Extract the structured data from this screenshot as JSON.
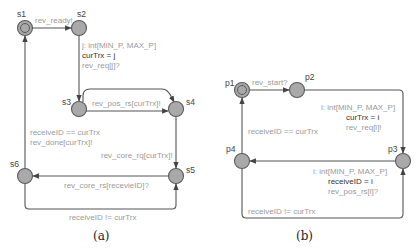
{
  "diagram_a": {
    "caption": "(a)",
    "nodes": {
      "s1": "s1",
      "s2": "s2",
      "s3": "s3",
      "s4": "s4",
      "s5": "s5",
      "s6": "s6"
    },
    "edges": {
      "s1_s2": "rev_ready!",
      "s2_s3_select": "j: int[MIN_P, MAX_P]",
      "s2_s3_update": "curTrx = j",
      "s2_s3_sync": "rev_req[j]?",
      "s3_s4": "rev_pos_rs[curTrx]!",
      "s4_s5": "rev_core_rq[curTrx]!",
      "s5_s6": "rev_core_rs[recevieID]?",
      "s6_s1_guard": "receiveID == curTrx",
      "s6_s1_sync": "rev_done[curTrx]!",
      "s6_s5_loop": "receiveID != curTrx"
    }
  },
  "diagram_b": {
    "caption": "(b)",
    "nodes": {
      "p1": "p1",
      "p2": "p2",
      "p3": "p3",
      "p4": "p4"
    },
    "edges": {
      "p1_p2": "rev_start?",
      "p2_p3_select": "i: int[MIN_P, MAX_P]",
      "p2_p3_update": "curTrx = i",
      "p2_p3_sync": "rev_req[i]!",
      "p3_p4_select": "i: int[MIN_P, MAX_P]",
      "p3_p4_update": "receiveID = i",
      "p3_p4_sync": "rev_pos_rs[i]?",
      "p4_p1_guard": "receiveID == curTrx",
      "p4_p3_loop": "receiveID != curTrx"
    }
  },
  "colors": {
    "node_fill": "#a9a9a9",
    "edge_stroke": "#555555",
    "label_gray": "#9a9a9a",
    "label_dark": "#333333"
  }
}
